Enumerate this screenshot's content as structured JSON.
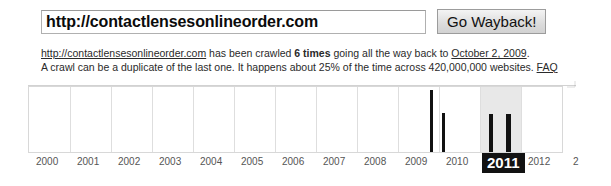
{
  "search": {
    "url_value": "http://contactlensesonlineorder.com",
    "url_placeholder": "Enter a URL",
    "go_button_label": "Go Wayback!"
  },
  "summary": {
    "line1_link": "http://contactlensesonlineorder.com",
    "line1_mid": " has been crawled ",
    "line1_count": "6 times",
    "line1_after": " going all the way back to ",
    "line1_date_link": "October 2, 2009",
    "line1_end": ".",
    "line2_a": "A crawl can be a duplicate of the last one. It happens about 25% of the time across 420,000,000 websites. ",
    "line2_faq": "FAQ"
  },
  "chart_data": {
    "type": "bar",
    "title": "",
    "xlabel": "",
    "ylabel": "",
    "grid": true,
    "legend": null,
    "categories": [
      "2000",
      "2001",
      "2002",
      "2003",
      "2004",
      "2005",
      "2006",
      "2007",
      "2008",
      "2009",
      "2010",
      "2011",
      "2012",
      "2"
    ],
    "selected_category": "2011",
    "total_crawls": 6,
    "bars": [
      {
        "year": "2009",
        "x": 429,
        "height_pct": 96,
        "width": 3
      },
      {
        "year": "2009",
        "x": 441,
        "height_pct": 60,
        "width": 3
      },
      {
        "year": "2011",
        "x": 488,
        "height_pct": 59,
        "width": 4
      },
      {
        "year": "2011",
        "x": 505,
        "height_pct": 59,
        "width": 5
      }
    ],
    "values_by_year": {
      "2000": 0,
      "2001": 0,
      "2002": 0,
      "2003": 0,
      "2004": 0,
      "2005": 0,
      "2006": 0,
      "2007": 0,
      "2008": 0,
      "2009": 2,
      "2010": 0,
      "2011": 2,
      "2012": 0
    },
    "axis_label_positions": [
      {
        "label": "2000",
        "x": 36
      },
      {
        "label": "2001",
        "x": 77
      },
      {
        "label": "2002",
        "x": 118
      },
      {
        "label": "2003",
        "x": 159
      },
      {
        "label": "2004",
        "x": 200
      },
      {
        "label": "2005",
        "x": 241
      },
      {
        "label": "2006",
        "x": 282
      },
      {
        "label": "2007",
        "x": 323
      },
      {
        "label": "2008",
        "x": 364
      },
      {
        "label": "2009",
        "x": 405
      },
      {
        "label": "2010",
        "x": 446
      },
      {
        "label": "2011",
        "x": 482
      },
      {
        "label": "2012",
        "x": 528
      },
      {
        "label": "2",
        "x": 573
      }
    ],
    "gridline_x": [
      69,
      110,
      151,
      192,
      233,
      274,
      315,
      356,
      397,
      438,
      479,
      520
    ],
    "highlight": {
      "x": 479,
      "width": 41,
      "color": "#e8e8e8"
    },
    "colors": {
      "bar": "#111111",
      "grid": "#dedede",
      "frame": "#d8d8d8",
      "selected_label_bg": "#121212",
      "selected_label_fg": "#ffffff"
    }
  }
}
